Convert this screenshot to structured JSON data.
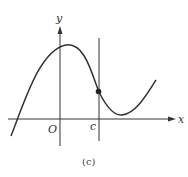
{
  "figure": {
    "axis_labels": {
      "x": "x",
      "y": "y"
    },
    "origin_label": "O",
    "marker_label": "c",
    "caption": "(c)",
    "colors": {
      "ink": "#333333",
      "background": "#ffffff"
    }
  }
}
